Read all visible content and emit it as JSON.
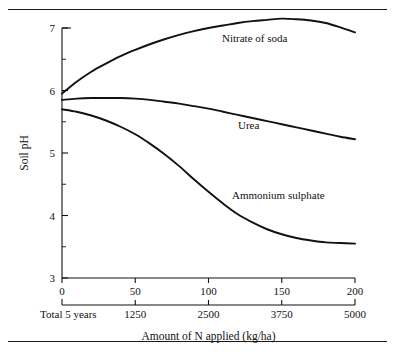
{
  "figure": {
    "background": "#ffffff",
    "ink_color": "#111111"
  },
  "chart_data": {
    "type": "line",
    "title": "",
    "xlabel": "Amount of N applied (kg/ha)",
    "ylabel": "Soil pH",
    "xlim": [
      0,
      200
    ],
    "ylim": [
      3,
      7
    ],
    "grid": false,
    "legend_position": "inline-labels",
    "x_ticks": [
      0,
      50,
      100,
      150,
      200
    ],
    "x_ticklabels": [
      "0",
      "50",
      "100",
      "150",
      "200"
    ],
    "y_ticks": [
      3,
      4,
      5,
      6,
      7
    ],
    "y_ticklabels": [
      "3",
      "4",
      "5",
      "6",
      "7"
    ],
    "y_minor_ticks": [
      3.5,
      4.5,
      5.5,
      6.5
    ],
    "secondary_axis": {
      "label": "Total 5 years",
      "ticks": [
        0,
        50,
        100,
        150,
        200
      ],
      "ticklabels": [
        "",
        "1250",
        "2500",
        "3750",
        "5000"
      ]
    },
    "series": [
      {
        "name": "Nitrate of soda",
        "label_x": 222,
        "label_y": 42,
        "x": [
          0,
          10,
          20,
          30,
          40,
          50,
          60,
          70,
          80,
          90,
          100,
          110,
          120,
          130,
          140,
          150,
          160,
          170,
          180,
          190,
          200
        ],
        "y": [
          5.95,
          6.14,
          6.3,
          6.43,
          6.55,
          6.65,
          6.74,
          6.82,
          6.89,
          6.95,
          7.0,
          7.04,
          7.08,
          7.11,
          7.13,
          7.15,
          7.14,
          7.12,
          7.08,
          7.01,
          6.93
        ]
      },
      {
        "name": "Urea",
        "label_x": 238,
        "label_y": 129,
        "x": [
          0,
          10,
          20,
          30,
          40,
          50,
          60,
          70,
          80,
          90,
          100,
          110,
          120,
          130,
          140,
          150,
          160,
          170,
          180,
          190,
          200
        ],
        "y": [
          5.85,
          5.87,
          5.88,
          5.88,
          5.88,
          5.87,
          5.85,
          5.82,
          5.79,
          5.75,
          5.71,
          5.66,
          5.61,
          5.56,
          5.51,
          5.46,
          5.41,
          5.36,
          5.31,
          5.26,
          5.22
        ]
      },
      {
        "name": "Ammonium sulphate",
        "label_x": 232,
        "label_y": 199,
        "x": [
          0,
          10,
          20,
          30,
          40,
          50,
          60,
          70,
          80,
          90,
          100,
          110,
          120,
          130,
          140,
          150,
          160,
          170,
          180,
          190,
          200
        ],
        "y": [
          5.7,
          5.66,
          5.6,
          5.52,
          5.42,
          5.3,
          5.15,
          4.98,
          4.79,
          4.58,
          4.38,
          4.19,
          4.02,
          3.89,
          3.78,
          3.7,
          3.64,
          3.6,
          3.57,
          3.56,
          3.55
        ]
      }
    ]
  }
}
